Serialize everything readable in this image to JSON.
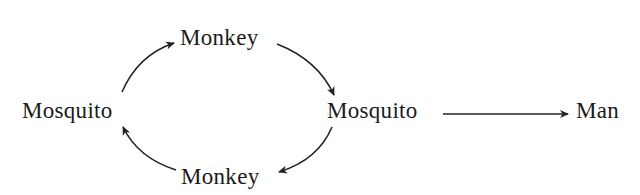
{
  "diagram": {
    "type": "transmission-cycle",
    "nodes": [
      {
        "id": "mosquito-left",
        "label": "Mosquito"
      },
      {
        "id": "monkey-top",
        "label": "Monkey"
      },
      {
        "id": "mosquito-right",
        "label": "Mosquito"
      },
      {
        "id": "monkey-bottom",
        "label": "Monkey"
      },
      {
        "id": "man",
        "label": "Man"
      }
    ],
    "edges": [
      {
        "from": "mosquito-left",
        "to": "monkey-top",
        "style": "curved"
      },
      {
        "from": "monkey-top",
        "to": "mosquito-right",
        "style": "curved"
      },
      {
        "from": "mosquito-right",
        "to": "monkey-bottom",
        "style": "curved"
      },
      {
        "from": "monkey-bottom",
        "to": "mosquito-left",
        "style": "curved"
      },
      {
        "from": "mosquito-right",
        "to": "man",
        "style": "straight"
      }
    ],
    "colors": {
      "text": "#1a1a1a",
      "arrow": "#222222",
      "background": "#ffffff"
    }
  }
}
